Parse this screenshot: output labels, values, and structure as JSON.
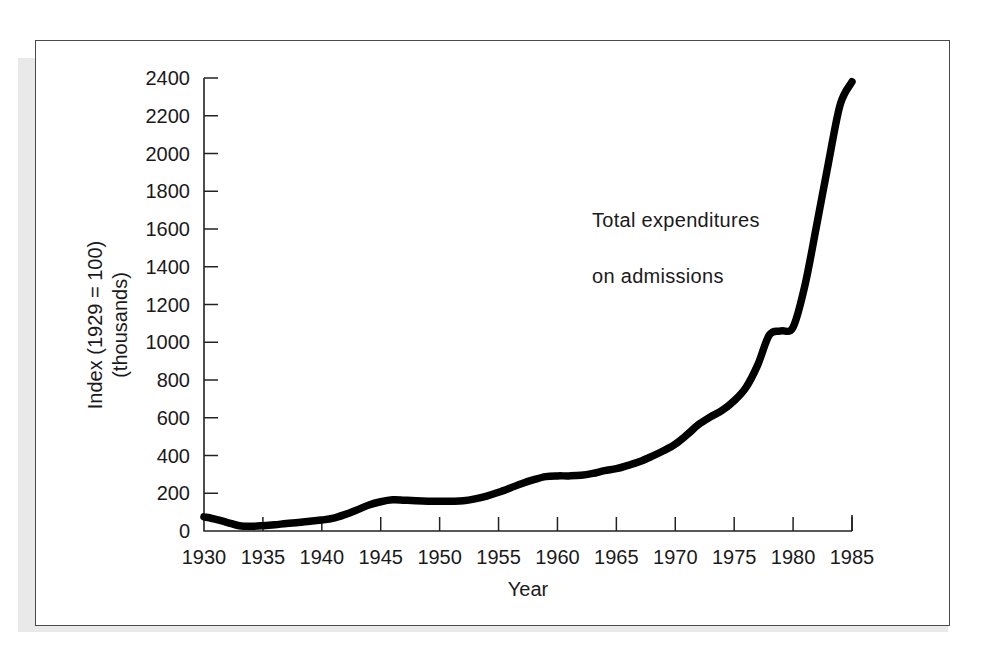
{
  "figure": {
    "frame_color": "#4a4a4a",
    "background": "#ffffff",
    "series_color": "#000000"
  },
  "chart_data": {
    "type": "line",
    "title": "",
    "subtitle": "",
    "xlabel": "Year",
    "ylabel": "Index (1929 = 100)\n(thousands)",
    "ylabel_line1": "Index (1929 = 100)",
    "ylabel_line2": "(thousands)",
    "annotation": "Total  expenditures\non admissions",
    "annotation_line1": "Total  expenditures",
    "annotation_line2": "on admissions",
    "legend_position": "inline-annotation",
    "grid": false,
    "xlim": [
      1930,
      1985
    ],
    "ylim": [
      0,
      2400
    ],
    "xticks": [
      1930,
      1935,
      1940,
      1945,
      1950,
      1955,
      1960,
      1965,
      1970,
      1975,
      1980,
      1985
    ],
    "xtick_labels": [
      "1930",
      "1935",
      "1940",
      "1945",
      "1950",
      "1955",
      "1960",
      "1965",
      "1970",
      "1975",
      "1980",
      "1985"
    ],
    "yticks": [
      0,
      200,
      400,
      600,
      800,
      1000,
      1200,
      1400,
      1600,
      1800,
      2000,
      2200,
      2400
    ],
    "ytick_labels": [
      "0",
      "200",
      "400",
      "600",
      "800",
      "1000",
      "1200",
      "1400",
      "1600",
      "1800",
      "2000",
      "2200",
      "2400"
    ],
    "series": [
      {
        "name": "Total expenditures on admissions",
        "x": [
          1930,
          1931,
          1932,
          1933,
          1934,
          1935,
          1936,
          1937,
          1938,
          1939,
          1940,
          1941,
          1942,
          1943,
          1944,
          1945,
          1946,
          1947,
          1948,
          1949,
          1950,
          1951,
          1952,
          1953,
          1954,
          1955,
          1956,
          1957,
          1958,
          1959,
          1960,
          1961,
          1962,
          1963,
          1964,
          1965,
          1966,
          1967,
          1968,
          1969,
          1970,
          1971,
          1972,
          1973,
          1974,
          1975,
          1976,
          1977,
          1978,
          1979,
          1980,
          1981,
          1982,
          1983,
          1984,
          1985
        ],
        "values": [
          75,
          62,
          45,
          28,
          25,
          28,
          33,
          40,
          45,
          52,
          58,
          68,
          88,
          112,
          138,
          155,
          165,
          163,
          160,
          158,
          158,
          158,
          160,
          170,
          185,
          205,
          228,
          252,
          272,
          288,
          292,
          292,
          295,
          305,
          320,
          330,
          348,
          368,
          395,
          425,
          460,
          510,
          565,
          605,
          640,
          690,
          760,
          880,
          1040,
          1060,
          1080,
          1300,
          1620,
          1950,
          2260,
          2380
        ]
      }
    ]
  }
}
